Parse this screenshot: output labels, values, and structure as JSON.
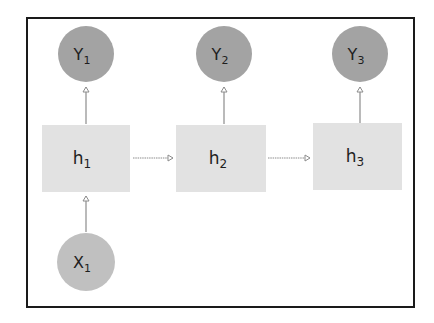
{
  "diagram": {
    "type": "recurrent-neural-network-unrolled",
    "colors": {
      "output_node": "#a3a3a3",
      "input_node": "#c0c0c0",
      "hidden_box": "#e2e2e2",
      "arrow": "#8c8c8c",
      "border": "#1a1a1a",
      "text": "#1e1e1e"
    },
    "outputs": [
      {
        "id": "Y1",
        "base": "Y",
        "sub": "1"
      },
      {
        "id": "Y2",
        "base": "Y",
        "sub": "2"
      },
      {
        "id": "Y3",
        "base": "Y",
        "sub": "3"
      }
    ],
    "hidden": [
      {
        "id": "h1",
        "base": "h",
        "sub": "1"
      },
      {
        "id": "h2",
        "base": "h",
        "sub": "2"
      },
      {
        "id": "h3",
        "base": "h",
        "sub": "3"
      }
    ],
    "inputs": [
      {
        "id": "X1",
        "base": "X",
        "sub": "1"
      }
    ],
    "edges": [
      {
        "from": "X1",
        "to": "h1"
      },
      {
        "from": "h1",
        "to": "Y1"
      },
      {
        "from": "h1",
        "to": "h2"
      },
      {
        "from": "h2",
        "to": "Y2"
      },
      {
        "from": "h2",
        "to": "h3"
      },
      {
        "from": "h3",
        "to": "Y3"
      }
    ]
  }
}
